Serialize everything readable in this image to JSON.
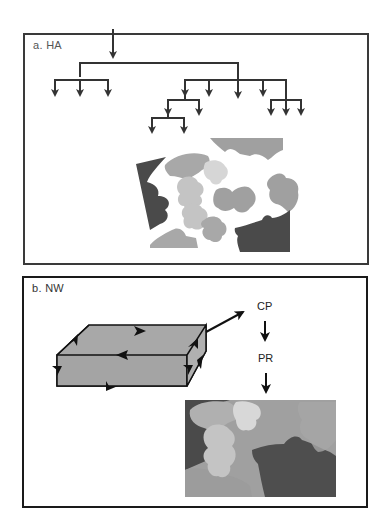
{
  "panels": [
    {
      "id": "a",
      "label": "a.  HA",
      "content": "hierarchical arrow tree above scattered grayscale puzzle pieces"
    },
    {
      "id": "b",
      "label": "b.  NW",
      "flow": [
        "CP",
        "PR"
      ],
      "content": "gray slab with circulating arrows, arrow to CP, down arrow to PR, down arrow to assembled puzzle"
    }
  ],
  "colors": {
    "line": "#333333",
    "panel_a_border": "#3a3a3a",
    "panel_b_border": "#1a1a1a",
    "box_fill": "#a8a8a8",
    "piece_dark": "#4a4a4a",
    "piece_mid": "#a0a0a0",
    "piece_light": "#c4c4c4",
    "piece_lightest": "#d6d6d6"
  }
}
